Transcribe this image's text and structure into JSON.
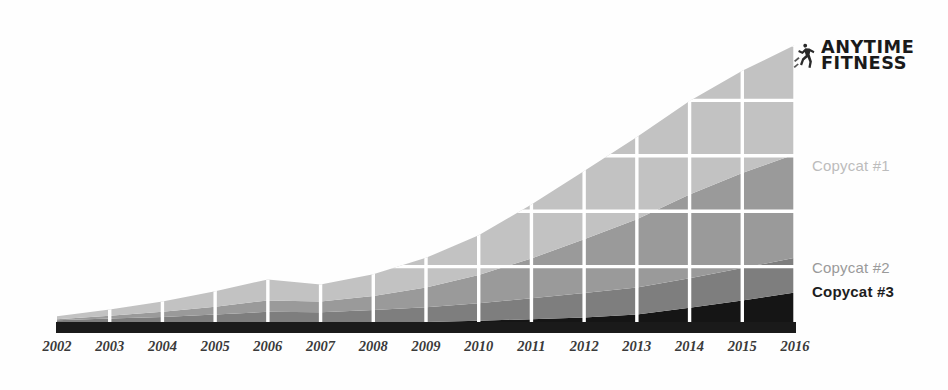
{
  "logo": {
    "line1": "ANYTIME",
    "line2": "FITNESS",
    "mark": "runner-icon"
  },
  "labels": {
    "copycat1": "Copycat #1",
    "copycat2": "Copycat #2",
    "copycat3": "Copycat #3"
  },
  "chart_data": {
    "type": "area",
    "stacked": true,
    "title": "",
    "xlabel": "",
    "ylabel": "",
    "grid": true,
    "legend_position": "right-inline",
    "categories": [
      "2002",
      "2003",
      "2004",
      "2005",
      "2006",
      "2007",
      "2008",
      "2009",
      "2010",
      "2011",
      "2012",
      "2013",
      "2014",
      "2015",
      "2016"
    ],
    "ylim": [
      0,
      100
    ],
    "gridlines_y": [
      0,
      20,
      40,
      60,
      80,
      100
    ],
    "series": [
      {
        "name": "Copycat #3",
        "color": "#151515",
        "order": 1,
        "values": [
          0,
          0,
          0,
          0,
          0,
          0,
          0,
          0,
          0.4,
          1.0,
          1.6,
          2.6,
          5.0,
          7.6,
          10.4
        ]
      },
      {
        "name": "Copycat #2",
        "color": "#7e7e7e",
        "order": 2,
        "values": [
          0.6,
          1.2,
          1.8,
          2.6,
          3.6,
          3.4,
          4.2,
          5.2,
          6.2,
          7.4,
          8.6,
          9.6,
          10.4,
          11.4,
          12.2
        ]
      },
      {
        "name": "Copycat #1",
        "color": "#9a9a9a",
        "order": 3,
        "values": [
          0.4,
          1.0,
          1.8,
          2.8,
          4.0,
          3.8,
          5.0,
          7.0,
          10.0,
          14.0,
          19.0,
          24.0,
          29.5,
          33.5,
          36.5
        ]
      },
      {
        "name": "Anytime Fitness",
        "color": "#c2c2c2",
        "order": 4,
        "values": [
          1.0,
          2.2,
          3.6,
          5.4,
          7.4,
          6.0,
          7.6,
          10.4,
          14.0,
          19.0,
          24.0,
          29.0,
          33.0,
          36.0,
          38.5
        ]
      }
    ],
    "baseline_band": {
      "name": "axis-base-band",
      "color": "#1a1a1a"
    }
  }
}
